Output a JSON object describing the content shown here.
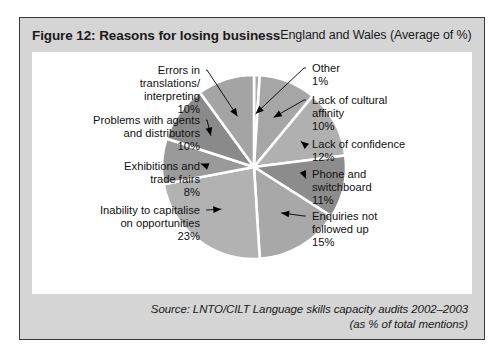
{
  "figure": {
    "title": "Figure 12: Reasons for losing business",
    "subtitle": "England and Wales (Average of %)",
    "source_line_1": "Source: LNTO/CILT Language skills capacity audits 2002–2003",
    "source_line_2": "(as % of total mentions)"
  },
  "chart_data": {
    "type": "pie",
    "title": "Figure 12: Reasons for losing business",
    "subtitle": "England and Wales (Average of %)",
    "unit": "%",
    "total": 100,
    "legend_position": "callout-labels",
    "grid": false,
    "categories": [
      "Other",
      "Lack of cultural affinity",
      "Lack of confidence",
      "Phone and switchboard",
      "Enquiries not followed up",
      "Inability to capitalise on opportunities",
      "Exhibitions and trade fairs",
      "Problems with agents and distributors",
      "Errors in translations/interpreting"
    ],
    "values": [
      1,
      10,
      12,
      11,
      15,
      23,
      8,
      10,
      10
    ],
    "colors": [
      "#aaaaaa",
      "#a6a6a6",
      "#b0b0b0",
      "#8c8c8c",
      "#a8a8a8",
      "#b2b2b2",
      "#9a9a9a",
      "#8a8a8a",
      "#a4a4a4"
    ],
    "slices": [
      {
        "label": "Other",
        "value": 1,
        "value_label": "1%",
        "side": "right"
      },
      {
        "label": "Lack of cultural affinity",
        "value": 10,
        "value_label": "10%",
        "side": "right"
      },
      {
        "label": "Lack of confidence",
        "value": 12,
        "value_label": "12%",
        "side": "right"
      },
      {
        "label": "Phone and switchboard",
        "value": 11,
        "value_label": "11%",
        "side": "right"
      },
      {
        "label": "Enquiries not followed up",
        "value": 15,
        "value_label": "15%",
        "side": "right"
      },
      {
        "label": "Inability to capitalise on opportunities",
        "value": 23,
        "value_label": "23%",
        "side": "left"
      },
      {
        "label": "Exhibitions and trade fairs",
        "value": 8,
        "value_label": "8%",
        "side": "left"
      },
      {
        "label": "Problems with agents and distributors",
        "value": 10,
        "value_label": "10%",
        "side": "left"
      },
      {
        "label": "Errors in translations/interpreting",
        "value": 10,
        "value_label": "10%",
        "side": "left"
      }
    ]
  },
  "labels": {
    "left": [
      {
        "lines": [
          "Errors in",
          "translations/",
          "interpreting"
        ],
        "value_label": "10%"
      },
      {
        "lines": [
          "Problems with agents",
          "and distributors"
        ],
        "value_label": "10%"
      },
      {
        "lines": [
          "Exhibitions and",
          "trade fairs"
        ],
        "value_label": "8%"
      },
      {
        "lines": [
          "Inability to capitalise",
          "on opportunities"
        ],
        "value_label": "23%"
      }
    ],
    "right": [
      {
        "lines": [
          "Other"
        ],
        "value_label": "1%"
      },
      {
        "lines": [
          "Lack of cultural",
          "affinity"
        ],
        "value_label": "10%"
      },
      {
        "lines": [
          "Lack of confidence"
        ],
        "value_label": "12%"
      },
      {
        "lines": [
          "Phone and",
          "switchboard"
        ],
        "value_label": "11%"
      },
      {
        "lines": [
          "Enquiries not",
          "followed up"
        ],
        "value_label": "15%"
      }
    ]
  }
}
